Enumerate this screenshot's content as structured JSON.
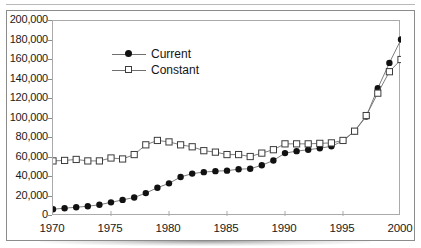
{
  "chart_data": {
    "type": "line",
    "title": "",
    "subtitle": "",
    "xlabel": "",
    "ylabel": "",
    "xlim": [
      1970,
      2000
    ],
    "ylim": [
      0,
      200000
    ],
    "ytick_step": 20000,
    "xtick_step": 5,
    "grid": false,
    "legend_position": "upper-left-inside",
    "x": [
      1970,
      1971,
      1972,
      1973,
      1974,
      1975,
      1976,
      1977,
      1978,
      1979,
      1980,
      1981,
      1982,
      1983,
      1984,
      1985,
      1986,
      1987,
      1988,
      1989,
      1990,
      1991,
      1992,
      1993,
      1994,
      1995,
      1996,
      1997,
      1998,
      1999,
      2000
    ],
    "ytick_labels": [
      "200,000",
      "180,000",
      "160,000",
      "140,000",
      "120,000",
      "100,000",
      "80,000",
      "60,000",
      "40,000",
      "20,000",
      "0"
    ],
    "ytick_values": [
      200000,
      180000,
      160000,
      140000,
      120000,
      100000,
      80000,
      60000,
      40000,
      20000,
      0
    ],
    "xtick_labels": [
      "1970",
      "1975",
      "1980",
      "1985",
      "1990",
      "1995",
      "2000"
    ],
    "xtick_values": [
      1970,
      1975,
      1980,
      1985,
      1990,
      1995,
      2000
    ],
    "series": [
      {
        "name": "Current",
        "marker": "filled-circle",
        "color": "#111111",
        "values": [
          7000,
          8000,
          9000,
          10000,
          11500,
          14000,
          16500,
          19000,
          23500,
          29000,
          33500,
          40000,
          43500,
          45000,
          46000,
          46500,
          48000,
          48500,
          52000,
          57000,
          64500,
          66500,
          68000,
          69500,
          71500,
          77000,
          87000,
          102000,
          131000,
          157000,
          181000
        ]
      },
      {
        "name": "Constant",
        "marker": "open-square",
        "color": "#3c3c3c",
        "values": [
          56500,
          57000,
          58000,
          56500,
          56500,
          59500,
          58500,
          63000,
          73000,
          77500,
          76000,
          73000,
          71000,
          67000,
          65500,
          63000,
          63000,
          61000,
          64500,
          68000,
          74000,
          74000,
          74000,
          74500,
          75000,
          77500,
          87000,
          103000,
          126000,
          148000,
          160500
        ]
      }
    ]
  },
  "legend": {
    "items": [
      {
        "label": "Current",
        "marker": "filled-circle"
      },
      {
        "label": "Constant",
        "marker": "open-square"
      }
    ]
  }
}
